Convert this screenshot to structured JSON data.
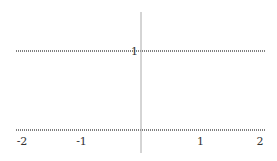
{
  "chart_data": {
    "type": "line",
    "title": "",
    "xlabel": "",
    "ylabel": "",
    "xlim": [
      -2.1,
      2.1
    ],
    "ylim": [
      -0.3,
      1.5
    ],
    "grid": false,
    "legend": null,
    "x_ticks": [
      -2,
      -1,
      1,
      2
    ],
    "x_tick_labels": [
      "-2",
      "-1",
      "1",
      "2"
    ],
    "y_ticks": [
      1
    ],
    "y_tick_labels": [
      "1"
    ],
    "series": [
      {
        "name": "y = 1",
        "x": [
          -2.1,
          2.1
        ],
        "y": [
          1,
          1
        ],
        "style": "dotted",
        "color": "#555555"
      },
      {
        "name": "y = 0",
        "x": [
          -2.1,
          2.1
        ],
        "y": [
          0,
          0
        ],
        "style": "dotted",
        "color": "#555555"
      }
    ],
    "axis_color": "#aaaaaa"
  }
}
